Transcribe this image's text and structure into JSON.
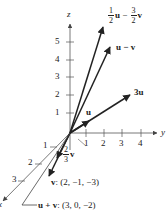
{
  "axes": {
    "x": {
      "label": "x",
      "ticks": [
        "1",
        "2",
        "3"
      ]
    },
    "y": {
      "label": "y",
      "ticks": [
        "1",
        "2",
        "3",
        "4"
      ]
    },
    "z": {
      "label": "z",
      "ticks": [
        "1",
        "2",
        "3",
        "4",
        "5"
      ]
    }
  },
  "vectors": {
    "half_u_minus_three_halves_v": {
      "coef1_num": "1",
      "coef1_den": "2",
      "sym1": "u",
      "op": "−",
      "coef2_num": "3",
      "coef2_den": "2",
      "sym2": "v"
    },
    "u_minus_v": {
      "label": "u − v"
    },
    "three_u": {
      "label": "3u"
    },
    "u": {
      "label": "u"
    },
    "two_thirds_v": {
      "num": "2",
      "den": "3",
      "sym": "v"
    },
    "v": {
      "label_bold": "v",
      "label_rest": ": (2, −1, −3)"
    },
    "u_plus_v": {
      "label_bold": "u + v",
      "label_rest": ": (3, 0, −2)"
    }
  },
  "colors": {
    "ink": "#222222",
    "axis": "#555555",
    "background": "#ffffff"
  }
}
